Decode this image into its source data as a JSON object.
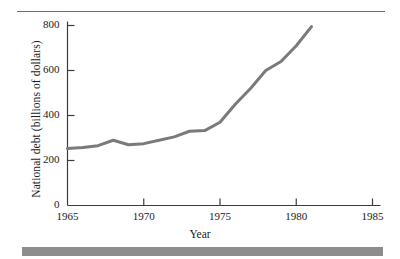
{
  "figure": {
    "caption_rule": "top-rule",
    "accent_color": "#8d8d8d",
    "line_color": "#7a7a7a",
    "axis_color": "#3c3c3c"
  },
  "chart_data": {
    "type": "line",
    "title": "",
    "xlabel": "Year",
    "ylabel": "National debt (billions of dollars)",
    "xlim": [
      1965,
      1985
    ],
    "ylim": [
      0,
      800
    ],
    "xticks": [
      1965,
      1970,
      1975,
      1980,
      1985
    ],
    "yticks": [
      0,
      200,
      400,
      600,
      800
    ],
    "xtick_labels": [
      "1965",
      "1970",
      "1975",
      "1980",
      "1985"
    ],
    "ytick_labels": [
      "0",
      "200",
      "400",
      "600",
      "800"
    ],
    "grid": false,
    "legend": "none",
    "series": [
      {
        "name": "National debt",
        "x": [
          1965,
          1966,
          1967,
          1968,
          1969,
          1970,
          1971,
          1972,
          1973,
          1974,
          1975,
          1976,
          1977,
          1978,
          1979,
          1980,
          1981
        ],
        "values": [
          253,
          258,
          266,
          290,
          270,
          275,
          290,
          305,
          330,
          333,
          370,
          450,
          520,
          600,
          640,
          710,
          795
        ]
      }
    ]
  },
  "axis_label_x": "Year",
  "axis_label_y": "National debt (billions of dollars)"
}
